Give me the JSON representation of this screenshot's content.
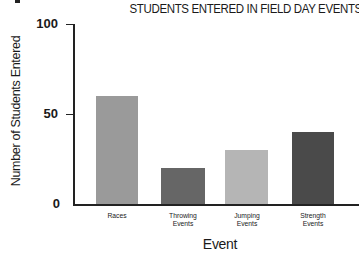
{
  "chart_data": {
    "type": "bar",
    "title": "STUDENTS ENTERED IN FIELD DAY EVENTS",
    "xlabel": "Event",
    "ylabel": "Number of Students Entered",
    "categories": [
      "Races",
      "Throwing Events",
      "Jumping Events",
      "Strength Events"
    ],
    "category_lines": [
      [
        "Races"
      ],
      [
        "Throwing",
        "Events"
      ],
      [
        "Jumping",
        "Events"
      ],
      [
        "Strength",
        "Events"
      ]
    ],
    "values": [
      60,
      20,
      30,
      40
    ],
    "colors": [
      "#9a9a9a",
      "#666666",
      "#b5b5b5",
      "#4a4a4a"
    ],
    "ylim": [
      0,
      100
    ],
    "yticks": [
      0,
      50,
      100
    ],
    "grid": false,
    "legend": null
  }
}
